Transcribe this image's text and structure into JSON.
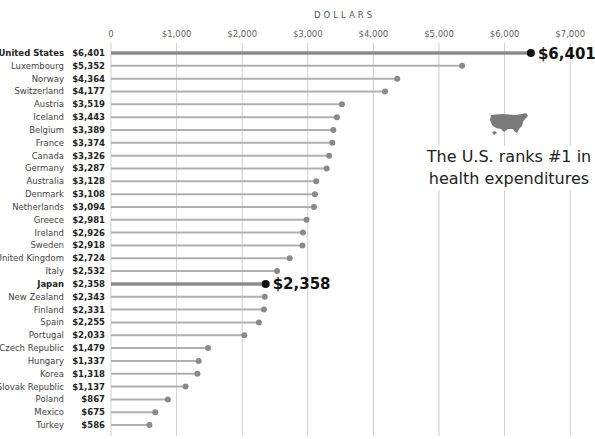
{
  "chart_data": {
    "type": "lollipop",
    "title": "",
    "xlabel": "DOLLARS",
    "ylabel": "",
    "xlim": [
      0,
      7000
    ],
    "x_ticks": [
      0,
      1000,
      2000,
      3000,
      4000,
      5000,
      6000,
      7000
    ],
    "x_tick_labels": [
      "0",
      "$1,000",
      "$2,000",
      "$3,000",
      "$4,000",
      "$5,000",
      "$6,000",
      "$7,000"
    ],
    "grid": true,
    "categories": [
      "United States",
      "Luxembourg",
      "Norway",
      "Switzerland",
      "Austria",
      "Iceland",
      "Belgium",
      "France",
      "Canada",
      "Germany",
      "Australia",
      "Denmark",
      "Netherlands",
      "Greece",
      "Ireland",
      "Sweden",
      "United Kingdom",
      "Italy",
      "Japan",
      "New Zealand",
      "Finland",
      "Spain",
      "Portugal",
      "Czech Republic",
      "Hungary",
      "Korea",
      "Slovak Republic",
      "Poland",
      "Mexico",
      "Turkey"
    ],
    "values": [
      6401,
      5352,
      4364,
      4177,
      3519,
      3443,
      3389,
      3374,
      3326,
      3287,
      3128,
      3108,
      3094,
      2981,
      2926,
      2918,
      2724,
      2532,
      2358,
      2343,
      2331,
      2255,
      2033,
      1479,
      1337,
      1318,
      1137,
      867,
      675,
      586
    ],
    "value_labels": [
      "$6,401",
      "$5,352",
      "$4,364",
      "$4,177",
      "$3,519",
      "$3,443",
      "$3,389",
      "$3,374",
      "$3,326",
      "$3,287",
      "$3,128",
      "$3,108",
      "$3,094",
      "$2,981",
      "$2,926",
      "$2,918",
      "$2,724",
      "$2,532",
      "$2,358",
      "$2,343",
      "$2,331",
      "$2,255",
      "$2,033",
      "$1,479",
      "$1,337",
      "$1,318",
      "$1,137",
      "$867",
      "$675",
      "$586"
    ],
    "highlighted": [
      "United States",
      "Japan"
    ],
    "highlight_labels": {
      "United States": "$6,401",
      "Japan": "$2,358"
    },
    "annotation": "The U.S. ranks #1 in health expenditures"
  },
  "colors": {
    "stem": "#b0b0b0",
    "dot": "#8a8a8a",
    "highlight_stem": "#8c8c8c",
    "highlight_dot": "#111111",
    "grid": "#cfcfcf",
    "map": "#7a7a7a"
  },
  "callout": {
    "line1": "The U.S. ranks #1 in",
    "line2": "health expenditures",
    "icon": "us-map-icon"
  }
}
